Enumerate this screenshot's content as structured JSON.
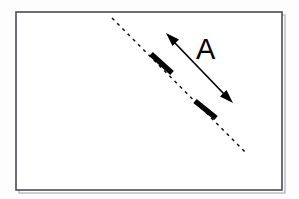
{
  "figure": {
    "background_color": "#fdfdfd",
    "frame": {
      "name": "diagram-frame",
      "x": 16,
      "y": 12,
      "width": 266,
      "height": 178,
      "fill": "#ffffff",
      "stroke_color": "#4a4a55",
      "stroke_width": 1.6
    },
    "dashed_line": {
      "name": "dashed-reference-line",
      "x1": 112,
      "y1": 18,
      "x2": 246,
      "y2": 153,
      "color": "#101010",
      "dash_pattern": "3.2 4.2",
      "stroke_width": 1.5
    },
    "bars": [
      {
        "name": "upper-thick-segment",
        "x1": 151,
        "y1": 54,
        "x2": 172,
        "y2": 73,
        "color": "#050505",
        "stroke_width": 5.4
      },
      {
        "name": "lower-thick-segment",
        "x1": 195,
        "y1": 101,
        "x2": 216,
        "y2": 118,
        "color": "#050505",
        "stroke_width": 5.4
      }
    ],
    "arrow": {
      "name": "double-headed-arrow",
      "x1": 166,
      "y1": 33,
      "x2": 233,
      "y2": 103,
      "color": "#000000",
      "stroke_width": 1.7,
      "heads": "both"
    },
    "label": {
      "name": "label-a",
      "text": "A",
      "x": 196,
      "y": 59,
      "font_size": 29,
      "color": "#000000"
    }
  }
}
